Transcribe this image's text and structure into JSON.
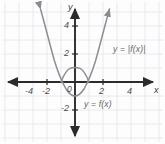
{
  "figure": {
    "title": "",
    "background_color": "#fdfdfd",
    "grid_color": "#e3e3e8",
    "axis_color": "#2b2b2b",
    "curve_color": "#8a8a92"
  },
  "axes": {
    "x_axis_label": "x",
    "y_axis_label": "y",
    "x_ticks": [
      "-4",
      "-2",
      "2",
      "4"
    ],
    "y_ticks": [
      "4",
      "2",
      "-2"
    ],
    "origin_label": "0"
  },
  "annotations": {
    "abs_label": "y = |f(x)|",
    "fn_label": "y = f(x)"
  },
  "chart_data": {
    "type": "line",
    "title": "",
    "xlabel": "x",
    "ylabel": "y",
    "xlim": [
      -5.4,
      5.4
    ],
    "ylim": [
      -3.6,
      5.6
    ],
    "xticks": [
      -4,
      -2,
      2,
      4
    ],
    "yticks": [
      4,
      2,
      -2
    ],
    "grid": true,
    "legend": "inline-annotations",
    "series": [
      {
        "name": "y = f(x)",
        "equation": "f(x) = x^2 - 1",
        "label_position": {
          "x": 0.6,
          "y": -1.9
        },
        "x": [
          -2.5,
          -2.25,
          -2,
          -1.75,
          -1.5,
          -1.25,
          -1,
          -0.75,
          -0.5,
          -0.25,
          0,
          0.25,
          0.5,
          0.75,
          1,
          1.25,
          1.5,
          1.75,
          2,
          2.25,
          2.5
        ],
        "values": [
          5.25,
          4.06,
          3,
          2.06,
          1.25,
          0.5625,
          0,
          -0.4375,
          -0.75,
          -0.9375,
          -1,
          -0.9375,
          -0.75,
          -0.4375,
          0,
          0.5625,
          1.25,
          2.06,
          3,
          4.06,
          5.25
        ],
        "roots": [
          -1,
          1
        ],
        "vertex": [
          0,
          -1
        ]
      },
      {
        "name": "y = |f(x)|",
        "equation": "|f(x)| = |x^2 - 1|",
        "label_position": {
          "x": 2.2,
          "y": 2.4
        },
        "x": [
          -2.5,
          -2.25,
          -2,
          -1.75,
          -1.5,
          -1.25,
          -1,
          -0.75,
          -0.5,
          -0.25,
          0,
          0.25,
          0.5,
          0.75,
          1,
          1.25,
          1.5,
          1.75,
          2,
          2.25,
          2.5
        ],
        "values": [
          5.25,
          4.06,
          3,
          2.06,
          1.25,
          0.5625,
          0,
          0.4375,
          0.75,
          0.9375,
          1,
          0.9375,
          0.75,
          0.4375,
          0,
          0.5625,
          1.25,
          2.06,
          3,
          4.06,
          5.25
        ],
        "peak": [
          0,
          1
        ]
      }
    ]
  }
}
